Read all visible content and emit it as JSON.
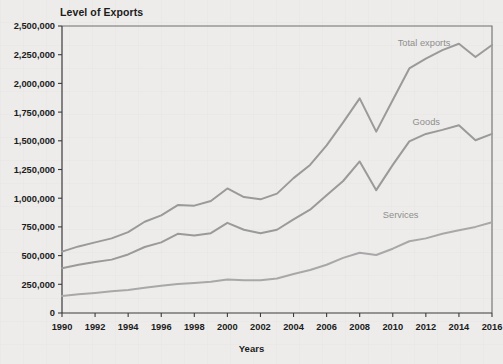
{
  "chart_data": {
    "type": "line",
    "title": "Level of Exports",
    "xlabel": "Years",
    "ylabel": "",
    "xlim": [
      1990,
      2016
    ],
    "ylim": [
      0,
      2500000
    ],
    "ytick_labels": [
      "0",
      "250,000",
      "500,000",
      "750,000",
      "1,000,000",
      "1,250,000",
      "1,500,000",
      "1,750,000",
      "2,000,000",
      "2,250,000",
      "2,500,000"
    ],
    "ytick_values": [
      0,
      250000,
      500000,
      750000,
      1000000,
      1250000,
      1500000,
      1750000,
      2000000,
      2250000,
      2500000
    ],
    "xtick_labels": [
      "1990",
      "1992",
      "1994",
      "1996",
      "1998",
      "2000",
      "2002",
      "2004",
      "2006",
      "2008",
      "2010",
      "2012",
      "2014",
      "2016"
    ],
    "xtick_values": [
      1990,
      1992,
      1994,
      1996,
      1998,
      2000,
      2002,
      2004,
      2006,
      2008,
      2010,
      2012,
      2014,
      2016
    ],
    "x": [
      1990,
      1991,
      1992,
      1993,
      1994,
      1995,
      1996,
      1997,
      1998,
      1999,
      2000,
      2001,
      2002,
      2003,
      2004,
      2005,
      2006,
      2007,
      2008,
      2009,
      2010,
      2011,
      2012,
      2013,
      2014,
      2015,
      2016
    ],
    "grid": false,
    "legend_position": "inline-labels",
    "series": [
      {
        "name": "Total exports",
        "color": "#9a9a9a",
        "label_x": 2010.3,
        "label_y": 2330000,
        "values": [
          535000,
          580000,
          615000,
          650000,
          705000,
          795000,
          850000,
          940000,
          935000,
          975000,
          1085000,
          1010000,
          990000,
          1040000,
          1175000,
          1290000,
          1460000,
          1660000,
          1870000,
          1580000,
          1855000,
          2130000,
          2215000,
          2290000,
          2345000,
          2230000,
          2335000
        ]
      },
      {
        "name": "Goods",
        "color": "#9a9a9a",
        "label_x": 2011.2,
        "label_y": 1640000,
        "values": [
          390000,
          420000,
          445000,
          465000,
          510000,
          575000,
          615000,
          690000,
          675000,
          695000,
          785000,
          725000,
          695000,
          725000,
          815000,
          900000,
          1025000,
          1150000,
          1320000,
          1070000,
          1290000,
          1495000,
          1560000,
          1595000,
          1635000,
          1505000,
          1560000
        ]
      },
      {
        "name": "Services",
        "color": "#a8a8a8",
        "label_x": 2009.4,
        "label_y": 830000,
        "values": [
          148000,
          163000,
          175000,
          190000,
          200000,
          220000,
          237000,
          252000,
          262000,
          272000,
          292000,
          285000,
          285000,
          300000,
          340000,
          375000,
          420000,
          480000,
          525000,
          505000,
          560000,
          625000,
          650000,
          690000,
          720000,
          750000,
          790000
        ]
      }
    ]
  }
}
